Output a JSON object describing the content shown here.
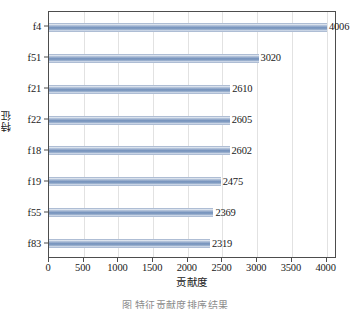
{
  "chart_data": {
    "type": "bar",
    "orientation": "horizontal",
    "title": "",
    "xlabel": "贡献度",
    "ylabel": "特征",
    "categories": [
      "f4",
      "f51",
      "f21",
      "f22",
      "f18",
      "f19",
      "f55",
      "f83"
    ],
    "values": [
      4006,
      3020,
      2610,
      2605,
      2602,
      2475,
      2369,
      2319
    ],
    "data_labels": [
      "4006",
      "3020",
      "2610",
      "2605",
      "2602",
      "2475",
      "2369",
      "2319"
    ],
    "xlim": [
      0,
      4150
    ],
    "xticks": [
      0,
      500,
      1000,
      1500,
      2000,
      2500,
      3000,
      3500,
      4000
    ],
    "xtick_labels": [
      "0",
      "500",
      "1000",
      "1500",
      "2000",
      "2500",
      "3000",
      "3500",
      "4000"
    ],
    "grid": "vertical-only",
    "legend": "none",
    "bar_color": "#7290bb",
    "bar_edge_color": "#aebdd4",
    "frame_color": "#4d4d4d",
    "gridline_color": "#e2e2e2",
    "background_color": "#ffffff"
  },
  "caption": {
    "text": "图 特征贡献度排序结果"
  }
}
